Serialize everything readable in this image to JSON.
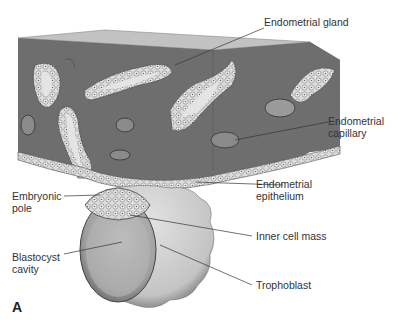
{
  "figure": {
    "panel_letter": "A",
    "labels": {
      "endometrial_gland": "Endometrial gland",
      "endometrial_capillary_1": "Endometrial",
      "endometrial_capillary_2": "capillary",
      "endometrial_epithelium_1": "Endometrial",
      "endometrial_epithelium_2": "epithelium",
      "embryonic_pole_1": "Embryonic",
      "embryonic_pole_2": "pole",
      "inner_cell_mass": "Inner cell mass",
      "blastocyst_cavity_1": "Blastocyst",
      "blastocyst_cavity_2": "cavity",
      "trophoblast": "Trophoblast"
    },
    "colors": {
      "tissue": "#6e6e6e",
      "tissue_top": "#bdbdbd",
      "tissue_side": "#7a7a7a",
      "cell": "#d9d9d9",
      "lumen": "#e6e6e6",
      "blastocyst": "#b8b8b8",
      "trophoblast": "#d6d6d6"
    }
  }
}
